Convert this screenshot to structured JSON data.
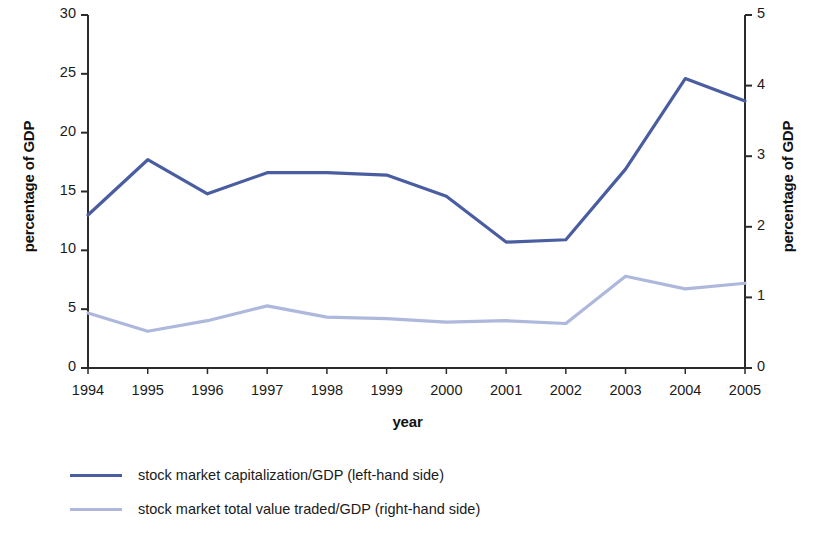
{
  "chart_data": {
    "type": "line",
    "title": "",
    "xlabel": "year",
    "ylabel": "percentage of GDP",
    "ylabel_right": "percentage of GDP",
    "grid": false,
    "legend_position": "bottom-left",
    "categories": [
      "1994",
      "1995",
      "1996",
      "1997",
      "1998",
      "1999",
      "2000",
      "2001",
      "2002",
      "2003",
      "2004",
      "2005"
    ],
    "ylim": [
      0,
      30
    ],
    "ylim_right": [
      0,
      5
    ],
    "yticks": [
      0,
      5,
      10,
      15,
      20,
      25,
      30
    ],
    "yticks_right": [
      0,
      1,
      2,
      3,
      4,
      5
    ],
    "series": [
      {
        "name": "stock market capitalization/GDP (left-hand side)",
        "axis": "left",
        "color": "#4A5DA0",
        "values": [
          13.0,
          17.7,
          14.8,
          16.6,
          16.6,
          16.4,
          14.6,
          10.7,
          10.9,
          16.9,
          24.6,
          22.7
        ]
      },
      {
        "name": "stock market total value traded/GDP (right-hand side)",
        "axis": "right",
        "color": "#AEB8DC",
        "values": [
          0.78,
          0.52,
          0.67,
          0.88,
          0.72,
          0.7,
          0.65,
          0.67,
          0.63,
          1.3,
          1.12,
          1.2
        ]
      }
    ]
  },
  "legend": {
    "items": [
      {
        "label": "stock market capitalization/GDP (left-hand side)",
        "color": "#4A5DA0"
      },
      {
        "label": "stock market total value traded/GDP (right-hand side)",
        "color": "#AEB8DC"
      }
    ]
  },
  "axes": {
    "left_title": "percentage of GDP",
    "right_title": "percentage of GDP",
    "x_title": "year"
  }
}
